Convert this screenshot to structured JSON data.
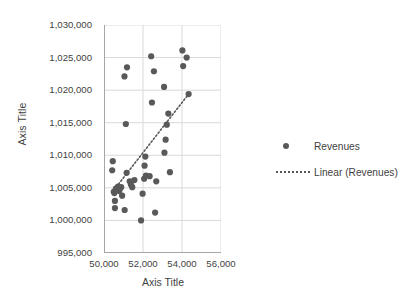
{
  "chart_data": {
    "type": "scatter",
    "title": "",
    "xlabel": "Axis Title",
    "ylabel": "Axis Title",
    "xlim": [
      50000,
      56000
    ],
    "ylim": [
      995000,
      1030000
    ],
    "xticks": [
      "50,000",
      "52,000",
      "54,000",
      "56,000"
    ],
    "xtick_values": [
      50000,
      52000,
      54000,
      56000
    ],
    "yticks": [
      "995,000",
      "1,000,000",
      "1,005,000",
      "1,010,000",
      "1,015,000",
      "1,020,000",
      "1,025,000",
      "1,030,000"
    ],
    "ytick_values": [
      995000,
      1000000,
      1005000,
      1010000,
      1015000,
      1020000,
      1025000,
      1030000
    ],
    "grid": true,
    "legend_position": "right",
    "series": [
      {
        "name": "Revenues",
        "type": "scatter",
        "marker": "circle",
        "color": "#595959",
        "points": [
          [
            50450,
            1009100
          ],
          [
            50420,
            1007700
          ],
          [
            50500,
            1004400
          ],
          [
            50530,
            1004200
          ],
          [
            50560,
            1003000
          ],
          [
            50610,
            1004900
          ],
          [
            50640,
            1004700
          ],
          [
            50700,
            1005000
          ],
          [
            50720,
            1005200
          ],
          [
            50780,
            1004500
          ],
          [
            50820,
            1004900
          ],
          [
            50880,
            1005100
          ],
          [
            50560,
            1001900
          ],
          [
            50930,
            1003800
          ],
          [
            51060,
            1001600
          ],
          [
            51050,
            1022100
          ],
          [
            51180,
            1023500
          ],
          [
            51120,
            1014800
          ],
          [
            51160,
            1007300
          ],
          [
            51320,
            1006000
          ],
          [
            51380,
            1005500
          ],
          [
            51450,
            1005100
          ],
          [
            51560,
            1006200
          ],
          [
            51900,
            1000000
          ],
          [
            51980,
            1004100
          ],
          [
            52060,
            1006400
          ],
          [
            52080,
            1008400
          ],
          [
            52120,
            1009800
          ],
          [
            52150,
            1006900
          ],
          [
            52340,
            1006800
          ],
          [
            52420,
            1025200
          ],
          [
            52460,
            1018100
          ],
          [
            52560,
            1022900
          ],
          [
            52620,
            1001200
          ],
          [
            52680,
            1006000
          ],
          [
            53080,
            1020500
          ],
          [
            53100,
            1010400
          ],
          [
            53160,
            1012400
          ],
          [
            53220,
            1014700
          ],
          [
            53300,
            1016400
          ],
          [
            53380,
            1007400
          ],
          [
            54020,
            1026100
          ],
          [
            54060,
            1023700
          ],
          [
            54240,
            1025000
          ],
          [
            54340,
            1019400
          ]
        ]
      },
      {
        "name": "Linear (Revenues)",
        "type": "trendline",
        "style": "dotted",
        "color": "#595959",
        "endpoints": [
          [
            50620,
            1005100
          ],
          [
            54340,
            1019400
          ]
        ]
      }
    ],
    "legend": [
      {
        "label": "Revenues",
        "key": "marker",
        "color": "#595959"
      },
      {
        "label": "Linear (Revenues)",
        "key": "dotted-line",
        "color": "#595959"
      }
    ]
  },
  "axes": {
    "y_title": "Axis Title",
    "x_title": "Axis Title"
  },
  "colors": {
    "marker": "#595959",
    "grid": "#d9d9d9",
    "axis": "#a6a6a6",
    "text": "#3f3f3f"
  }
}
